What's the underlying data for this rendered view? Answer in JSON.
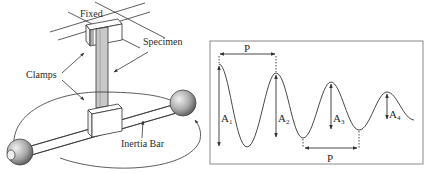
{
  "figure": {
    "left_panel": {
      "title": "Torsion pendulum apparatus",
      "labels": {
        "fixed": "Fixed",
        "specimen": "Specimen",
        "clamps": "Clamps",
        "inertia_bar": "Inertia Bar"
      }
    },
    "right_panel": {
      "title": "Damped oscillation",
      "labels": {
        "period_top": "P",
        "period_bottom": "P",
        "amplitudes": [
          "A",
          "A",
          "A",
          "A"
        ],
        "amplitude_subscripts": [
          "1",
          "2",
          "3",
          "4"
        ]
      }
    }
  },
  "colors": {
    "line": "#333333",
    "specimen_fill": "#c8c8c8",
    "sphere_light": "#e8e8e8",
    "sphere_dark": "#6a6a6a",
    "frame": "#8a8a8a"
  }
}
